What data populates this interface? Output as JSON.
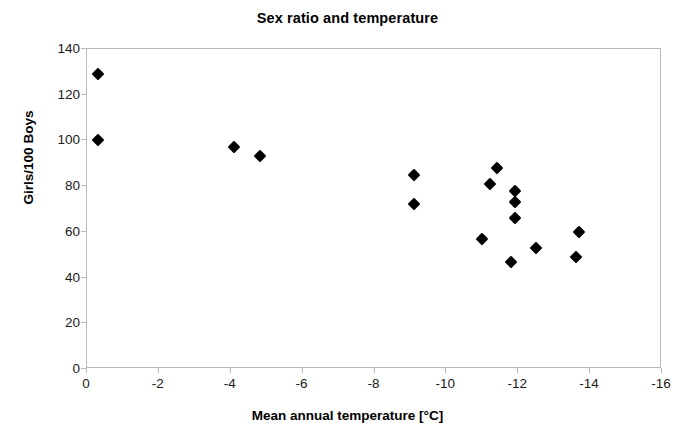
{
  "chart_data": {
    "type": "scatter",
    "title": "Sex ratio and temperature",
    "xlabel": "Mean annual temperature [°C]",
    "ylabel": "Girls/100 Boys",
    "xlim": [
      0,
      -16
    ],
    "ylim": [
      0,
      140
    ],
    "x_ticks": [
      0,
      -2,
      -4,
      -6,
      -8,
      -10,
      -12,
      -14,
      -16
    ],
    "x_tick_labels": [
      "0",
      "-2",
      "-4",
      "-6",
      "-8",
      "-10",
      "-12",
      "-14",
      "-16"
    ],
    "y_ticks": [
      0,
      20,
      40,
      60,
      80,
      100,
      120,
      140
    ],
    "y_tick_labels": [
      "0",
      "20",
      "40",
      "60",
      "80",
      "100",
      "120",
      "140"
    ],
    "grid": false,
    "legend": false,
    "marker": "filled-diamond",
    "marker_color": "#000000",
    "frame_color": "#b9b9b9",
    "series": [
      {
        "name": "Sex ratio vs mean annual temperature",
        "points": [
          {
            "x": -0.3,
            "y": 129
          },
          {
            "x": -0.3,
            "y": 100
          },
          {
            "x": -4.1,
            "y": 97
          },
          {
            "x": -4.8,
            "y": 93
          },
          {
            "x": -9.1,
            "y": 85
          },
          {
            "x": -9.1,
            "y": 72
          },
          {
            "x": -11.4,
            "y": 88
          },
          {
            "x": -11.2,
            "y": 81
          },
          {
            "x": -11.9,
            "y": 78
          },
          {
            "x": -11.9,
            "y": 73
          },
          {
            "x": -11.9,
            "y": 66
          },
          {
            "x": -11.0,
            "y": 57
          },
          {
            "x": -11.8,
            "y": 47
          },
          {
            "x": -12.5,
            "y": 53
          },
          {
            "x": -13.7,
            "y": 60
          },
          {
            "x": -13.6,
            "y": 49
          }
        ]
      }
    ]
  }
}
